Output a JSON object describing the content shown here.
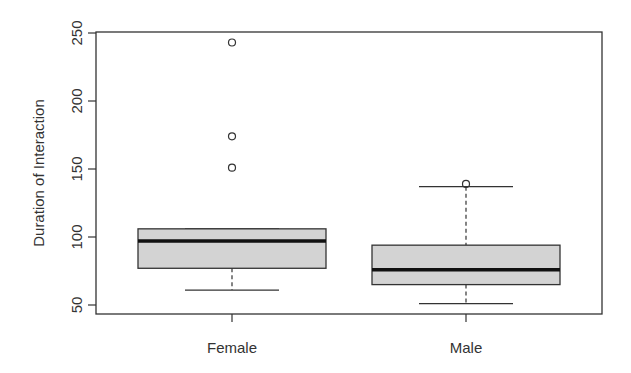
{
  "chart_data": {
    "type": "boxplot",
    "title": "",
    "xlabel": "",
    "ylabel": "Duration of Interaction",
    "ylim": [
      42,
      251
    ],
    "yticks": [
      50,
      100,
      150,
      200,
      250
    ],
    "categories": [
      "Female",
      "Male"
    ],
    "grid": false,
    "legend": null,
    "box_fill": "#d3d3d3",
    "series": [
      {
        "name": "Female",
        "whisker_low": 61,
        "q1": 77,
        "median": 97,
        "q3": 106,
        "whisker_high": 106,
        "outliers": [
          151,
          174,
          243
        ]
      },
      {
        "name": "Male",
        "whisker_low": 51,
        "q1": 65,
        "median": 76,
        "q3": 94,
        "whisker_high": 137,
        "outliers": [
          139
        ]
      }
    ]
  }
}
